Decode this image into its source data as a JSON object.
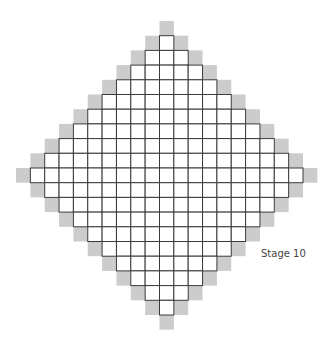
{
  "diagram": {
    "type": "growth-pattern",
    "stage_label": "Stage 10",
    "stage": 10,
    "shape": "diamond",
    "white_cells_count": 181,
    "gray_cells_count": 40,
    "colors": {
      "white_cell": "#ffffff",
      "gray_cell": "#cccccc",
      "grid_line": "#3a3a3a"
    }
  }
}
